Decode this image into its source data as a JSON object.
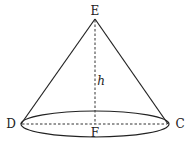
{
  "diagram": {
    "type": "cone",
    "points": {
      "apex": {
        "label": "E",
        "x": 95,
        "y": 19
      },
      "left": {
        "label": "D",
        "x": 21,
        "y": 124
      },
      "right": {
        "label": "C",
        "x": 168,
        "y": 124
      },
      "center": {
        "label": "F",
        "x": 95,
        "y": 124
      }
    },
    "height_label": "h",
    "base_ellipse": {
      "cx": 95,
      "cy": 124,
      "rx": 74,
      "ry": 13
    },
    "colors": {
      "stroke": "#222222",
      "background": "#ffffff"
    }
  }
}
